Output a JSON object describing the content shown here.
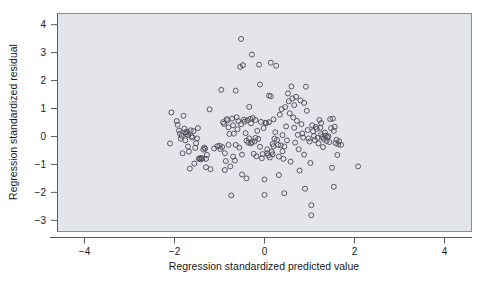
{
  "chart_data": {
    "type": "scatter",
    "title": "",
    "xlabel": "Regression standardized predicted value",
    "ylabel": "Regression standardized residual",
    "xlim": [
      -4.6,
      4.6
    ],
    "ylim": [
      -3.4,
      4.4
    ],
    "xticks": [
      -4,
      -2,
      0,
      2,
      4
    ],
    "xtick_labels": [
      "−4",
      "−2",
      "0",
      "2",
      "4"
    ],
    "yticks": [
      -3,
      -2,
      -1,
      0,
      1,
      2,
      3,
      4
    ],
    "ytick_labels": [
      "−3",
      "−2",
      "−1",
      "0",
      "1",
      "2",
      "3",
      "4"
    ],
    "grid": false,
    "legend": null,
    "marker": "open-circle",
    "marker_color": "#4a4a55",
    "panel_background": "#e3e5eb",
    "panel_border": "#8d8f96",
    "n_points": 201,
    "points": [
      [
        -2.07,
        0.86
      ],
      [
        -2.1,
        -0.25
      ],
      [
        -1.95,
        0.55
      ],
      [
        -1.93,
        0.42
      ],
      [
        -1.9,
        0.21
      ],
      [
        -1.88,
        0.1
      ],
      [
        -1.86,
        -0.08
      ],
      [
        -1.84,
        0.02
      ],
      [
        -1.82,
        -0.6
      ],
      [
        -1.8,
        0.74
      ],
      [
        -1.78,
        0.28
      ],
      [
        -1.76,
        0.15
      ],
      [
        -1.74,
        0.09
      ],
      [
        -1.72,
        0.17
      ],
      [
        -1.7,
        0.05
      ],
      [
        -1.7,
        -0.36
      ],
      [
        -1.68,
        -0.54
      ],
      [
        -1.66,
        -1.15
      ],
      [
        -1.64,
        0.22
      ],
      [
        -1.62,
        0.0
      ],
      [
        -1.6,
        -0.04
      ],
      [
        -1.58,
        0.19
      ],
      [
        -1.56,
        -0.97
      ],
      [
        -1.54,
        -0.41
      ],
      [
        -1.52,
        -0.24
      ],
      [
        -1.5,
        -0.07
      ],
      [
        -1.48,
        0.3
      ],
      [
        -1.46,
        -0.8
      ],
      [
        -1.44,
        -0.78
      ],
      [
        -1.42,
        -0.82
      ],
      [
        -1.4,
        -0.77
      ],
      [
        -1.38,
        -0.79
      ],
      [
        -1.36,
        -0.47
      ],
      [
        -1.34,
        -0.4
      ],
      [
        -1.32,
        -0.44
      ],
      [
        -1.3,
        -1.1
      ],
      [
        -1.28,
        -0.66
      ],
      [
        -1.22,
        0.97
      ],
      [
        -1.2,
        -1.17
      ],
      [
        -1.12,
        -0.43
      ],
      [
        -1.05,
        -0.35
      ],
      [
        -1.0,
        -0.33
      ],
      [
        -0.98,
        -0.45
      ],
      [
        -0.96,
        1.67
      ],
      [
        -0.94,
        -0.38
      ],
      [
        -0.92,
        0.51
      ],
      [
        -0.9,
        0.45
      ],
      [
        -0.88,
        -1.2
      ],
      [
        -0.86,
        -0.88
      ],
      [
        -0.84,
        0.62
      ],
      [
        -0.82,
        0.58
      ],
      [
        -0.8,
        0.33
      ],
      [
        -0.8,
        -0.3
      ],
      [
        -0.78,
        0.09
      ],
      [
        -0.76,
        -1.07
      ],
      [
        -0.74,
        -2.11
      ],
      [
        -0.72,
        0.64
      ],
      [
        -0.7,
        0.4
      ],
      [
        -0.7,
        -0.72
      ],
      [
        -0.68,
        0.1
      ],
      [
        -0.66,
        -0.86
      ],
      [
        -0.64,
        1.64
      ],
      [
        -0.62,
        0.69
      ],
      [
        -0.6,
        0.26
      ],
      [
        -0.58,
        0.55
      ],
      [
        -0.56,
        -0.4
      ],
      [
        -0.54,
        2.49
      ],
      [
        -0.52,
        3.49
      ],
      [
        -0.52,
        0.44
      ],
      [
        -0.5,
        -0.65
      ],
      [
        -0.5,
        -1.36
      ],
      [
        -0.48,
        2.55
      ],
      [
        -0.46,
        0.6
      ],
      [
        -0.44,
        0.53
      ],
      [
        -0.42,
        0.12
      ],
      [
        -0.4,
        -0.15
      ],
      [
        -0.4,
        -1.5
      ],
      [
        -0.38,
        0.58
      ],
      [
        -0.36,
        -0.22
      ],
      [
        -0.34,
        1.06
      ],
      [
        -0.34,
        -0.07
      ],
      [
        -0.32,
        0.63
      ],
      [
        -0.3,
        0.47
      ],
      [
        -0.3,
        -0.25
      ],
      [
        -0.28,
        2.93
      ],
      [
        -0.28,
        -0.2
      ],
      [
        -0.26,
        0.66
      ],
      [
        -0.24,
        -0.62
      ],
      [
        -0.22,
        -0.18
      ],
      [
        -0.2,
        0.59
      ],
      [
        -0.2,
        -0.05
      ],
      [
        -0.18,
        -0.71
      ],
      [
        -0.16,
        0.2
      ],
      [
        -0.14,
        -0.09
      ],
      [
        -0.12,
        2.57
      ],
      [
        -0.1,
        1.86
      ],
      [
        -0.1,
        -0.37
      ],
      [
        -0.08,
        0.52
      ],
      [
        -0.06,
        -0.78
      ],
      [
        -0.04,
        -0.63
      ],
      [
        -0.02,
        0.3
      ],
      [
        0.0,
        -2.09
      ],
      [
        0.0,
        -1.54
      ],
      [
        0.02,
        0.49
      ],
      [
        0.04,
        0.48
      ],
      [
        0.06,
        -0.6
      ],
      [
        0.08,
        -0.68
      ],
      [
        0.1,
        1.46
      ],
      [
        0.1,
        0.51
      ],
      [
        0.12,
        -0.75
      ],
      [
        0.14,
        2.64
      ],
      [
        0.14,
        1.44
      ],
      [
        0.16,
        -0.55
      ],
      [
        0.18,
        -0.27
      ],
      [
        0.2,
        0.61
      ],
      [
        0.2,
        -0.35
      ],
      [
        0.22,
        -0.08
      ],
      [
        0.24,
        0.15
      ],
      [
        0.26,
        2.53
      ],
      [
        0.28,
        -0.12
      ],
      [
        0.3,
        -0.3
      ],
      [
        0.32,
        -1.38
      ],
      [
        0.34,
        0.78
      ],
      [
        0.36,
        -0.32
      ],
      [
        0.38,
        0.98
      ],
      [
        0.4,
        0.05
      ],
      [
        0.4,
        -0.53
      ],
      [
        0.42,
        -0.8
      ],
      [
        0.44,
        -2.03
      ],
      [
        0.46,
        1.05
      ],
      [
        0.48,
        0.36
      ],
      [
        0.5,
        -0.14
      ],
      [
        0.52,
        1.54
      ],
      [
        0.54,
        1.26
      ],
      [
        0.56,
        0.83
      ],
      [
        0.58,
        -0.9
      ],
      [
        0.6,
        1.79
      ],
      [
        0.62,
        1.36
      ],
      [
        0.64,
        0.68
      ],
      [
        0.66,
        0.31
      ],
      [
        0.68,
        -0.22
      ],
      [
        0.7,
        1.42
      ],
      [
        0.72,
        0.56
      ],
      [
        0.74,
        0.06
      ],
      [
        0.76,
        -0.46
      ],
      [
        0.78,
        -1.22
      ],
      [
        0.8,
        1.29
      ],
      [
        0.82,
        0.44
      ],
      [
        0.84,
        0.11
      ],
      [
        0.86,
        -0.04
      ],
      [
        0.88,
        -0.65
      ],
      [
        0.9,
        -1.87
      ],
      [
        0.92,
        1.78
      ],
      [
        0.94,
        0.92
      ],
      [
        0.96,
        0.23
      ],
      [
        0.98,
        -0.07
      ],
      [
        1.0,
        -0.18
      ],
      [
        1.02,
        -0.95
      ],
      [
        1.04,
        -2.46
      ],
      [
        1.04,
        -2.82
      ],
      [
        1.06,
        0.4
      ],
      [
        1.08,
        0.19
      ],
      [
        1.1,
        0.02
      ],
      [
        1.12,
        -0.13
      ],
      [
        1.14,
        0.34
      ],
      [
        1.16,
        0.27
      ],
      [
        1.18,
        -0.05
      ],
      [
        1.2,
        -0.25
      ],
      [
        1.22,
        0.59
      ],
      [
        1.24,
        0.31
      ],
      [
        1.26,
        0.08
      ],
      [
        1.28,
        -0.02
      ],
      [
        1.3,
        -0.38
      ],
      [
        1.32,
        -0.09
      ],
      [
        1.34,
        0.14
      ],
      [
        1.36,
        0.03
      ],
      [
        1.38,
        -0.16
      ],
      [
        1.4,
        -0.03
      ],
      [
        1.42,
        0.01
      ],
      [
        1.44,
        -0.2
      ],
      [
        1.46,
        0.62
      ],
      [
        1.48,
        0.3
      ],
      [
        1.5,
        -1.12
      ],
      [
        1.52,
        0.64
      ],
      [
        1.54,
        0.2
      ],
      [
        1.54,
        -1.8
      ],
      [
        1.56,
        0.35
      ],
      [
        1.58,
        -0.24
      ],
      [
        1.6,
        -0.12
      ],
      [
        1.62,
        -0.66
      ],
      [
        1.64,
        -0.28
      ],
      [
        1.66,
        -0.17
      ],
      [
        1.7,
        -0.3
      ],
      [
        2.08,
        -1.07
      ],
      [
        -1.76,
        -0.14
      ],
      [
        -1.3,
        -0.8
      ],
      [
        -0.88,
        -0.6
      ],
      [
        0.18,
        -0.64
      ],
      [
        0.44,
        -0.36
      ],
      [
        0.66,
        1.12
      ],
      [
        0.88,
        1.2
      ],
      [
        1.26,
        0.48
      ],
      [
        0.32,
        -0.72
      ],
      [
        -0.64,
        -0.3
      ],
      [
        0.06,
        -0.46
      ]
    ]
  }
}
